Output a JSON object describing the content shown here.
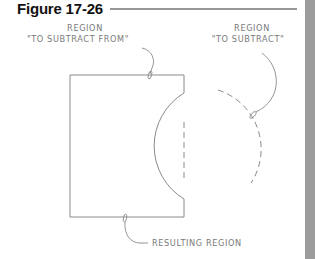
{
  "figure": {
    "title": "Figure 17-26"
  },
  "labels": {
    "subtract_from": {
      "line1": "REGION",
      "line2": "\"TO SUBTRACT FROM\""
    },
    "subtract": {
      "line1": "REGION",
      "line2": "\"TO SUBTRACT\""
    },
    "result": "RESULTING REGION"
  },
  "colors": {
    "line": "#8a8a8a",
    "text": "#7a7a7a",
    "title": "#111111",
    "side_bar": "#9c9c9c"
  }
}
